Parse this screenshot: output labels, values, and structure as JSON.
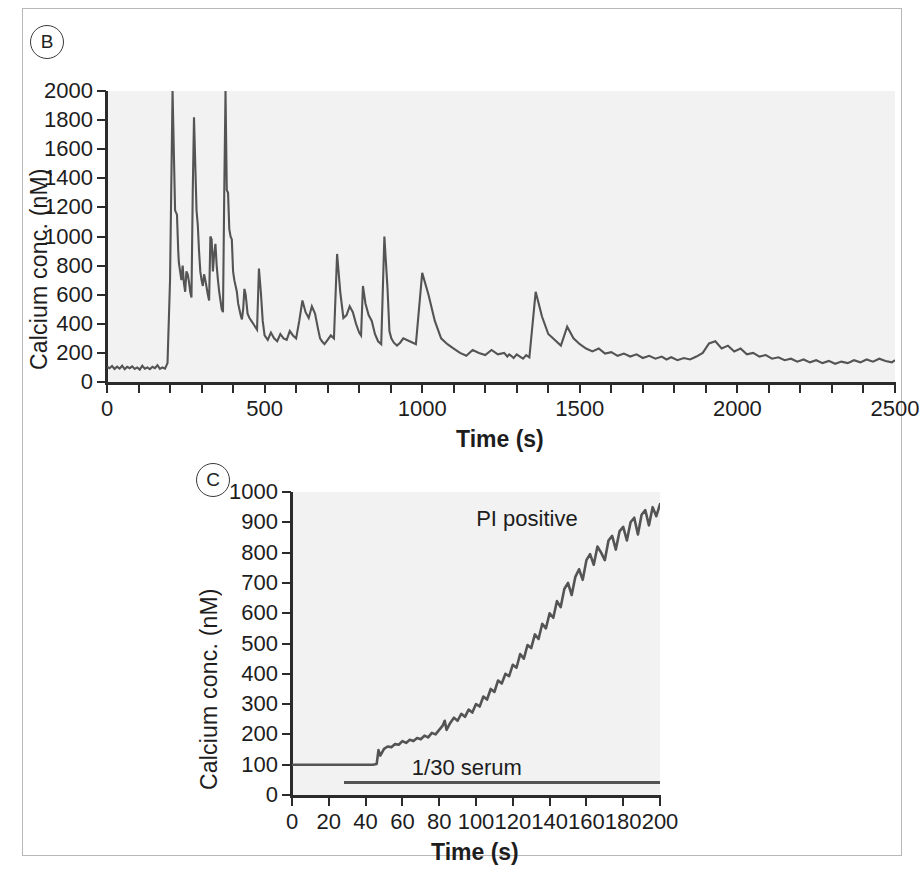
{
  "figure": {
    "panels": [
      {
        "tag": "B",
        "ylabel": "Calcium conc. (nM)",
        "xlabel": "Time (s)"
      },
      {
        "tag": "C",
        "ylabel": "Calcium conc. (nM)",
        "xlabel": "Time (s)",
        "annotation_pi": "PI positive",
        "annotation_serum": "1/30 serum"
      }
    ],
    "colors": {
      "trace": "#545454",
      "axis": "#2b2b2b",
      "plot_background": "#f2f2f2",
      "frame": "#b8b8b8",
      "text": "#1d1d1d"
    }
  },
  "chart_data": [
    {
      "type": "line",
      "panel": "B",
      "title": "",
      "xlabel": "Time (s)",
      "ylabel": "Calcium conc. (nM)",
      "xlim": [
        0,
        2500
      ],
      "ylim": [
        0,
        2000
      ],
      "xticks": [
        0,
        500,
        1000,
        1500,
        2000,
        2500
      ],
      "xtick_labels": [
        "0",
        "500",
        "1000",
        "1500",
        "2000",
        "2500"
      ],
      "xminor_interval": 100,
      "yticks": [
        0,
        200,
        400,
        600,
        800,
        1000,
        1200,
        1400,
        1600,
        1800,
        2000
      ],
      "ytick_labels": [
        "0",
        "200",
        "400",
        "600",
        "800",
        "1000",
        "1200",
        "1400",
        "1600",
        "1800",
        "2000"
      ],
      "grid": false,
      "legend": null,
      "series": [
        {
          "name": "Calcium trace (oscillating cell)",
          "description": "Baseline ~100 nM noise to t=225 s, then large spike train decaying to baseline by ~2000 s",
          "x": [
            0,
            8,
            16,
            24,
            32,
            40,
            48,
            56,
            64,
            72,
            80,
            88,
            96,
            104,
            112,
            120,
            128,
            136,
            144,
            152,
            160,
            168,
            176,
            184,
            192,
            200,
            208,
            216,
            222,
            226,
            228,
            232,
            236,
            240,
            244,
            248,
            252,
            256,
            260,
            264,
            268,
            272,
            276,
            280,
            284,
            288,
            292,
            296,
            300,
            304,
            308,
            312,
            316,
            320,
            324,
            328,
            332,
            336,
            340,
            344,
            348,
            352,
            356,
            360,
            364,
            368,
            372,
            376,
            380,
            384,
            388,
            392,
            396,
            400,
            404,
            408,
            412,
            416,
            420,
            424,
            428,
            432,
            436,
            440,
            446,
            452,
            458,
            464,
            470,
            476,
            482,
            488,
            494,
            500,
            510,
            520,
            530,
            540,
            550,
            560,
            570,
            580,
            590,
            600,
            610,
            620,
            630,
            640,
            650,
            660,
            670,
            676,
            682,
            690,
            700,
            710,
            720,
            730,
            740,
            750,
            760,
            770,
            780,
            790,
            800,
            806,
            812,
            820,
            830,
            840,
            850,
            860,
            870,
            880,
            890,
            896,
            902,
            910,
            920,
            930,
            940,
            960,
            980,
            1000,
            1020,
            1040,
            1060,
            1080,
            1100,
            1120,
            1140,
            1160,
            1180,
            1200,
            1220,
            1240,
            1260,
            1270,
            1276,
            1282,
            1290,
            1300,
            1310,
            1320,
            1330,
            1340,
            1360,
            1380,
            1400,
            1420,
            1440,
            1460,
            1480,
            1500,
            1520,
            1540,
            1560,
            1580,
            1600,
            1620,
            1640,
            1660,
            1680,
            1700,
            1720,
            1740,
            1760,
            1775,
            1790,
            1810,
            1830,
            1850,
            1870,
            1890,
            1910,
            1930,
            1950,
            1970,
            1990,
            2010,
            2030,
            2050,
            2070,
            2090,
            2110,
            2130,
            2150,
            2170,
            2190,
            2210,
            2230,
            2250,
            2270,
            2290,
            2310,
            2330,
            2350,
            2370,
            2390,
            2410,
            2430,
            2450,
            2470,
            2490,
            2500
          ],
          "y": [
            105,
            95,
            110,
            90,
            105,
            92,
            112,
            88,
            104,
            95,
            108,
            90,
            100,
            85,
            112,
            92,
            100,
            88,
            105,
            95,
            115,
            90,
            100,
            92,
            130,
            700,
            2000,
            1180,
            1150,
            900,
            820,
            760,
            700,
            800,
            680,
            620,
            760,
            740,
            690,
            620,
            580,
            1300,
            1820,
            1500,
            1180,
            1080,
            900,
            760,
            700,
            660,
            740,
            700,
            650,
            600,
            560,
            1000,
            980,
            760,
            880,
            950,
            800,
            700,
            620,
            560,
            500,
            480,
            1300,
            2000,
            1320,
            1300,
            1050,
            1000,
            980,
            760,
            700,
            660,
            620,
            540,
            500,
            460,
            430,
            500,
            640,
            600,
            470,
            440,
            420,
            400,
            380,
            360,
            780,
            620,
            420,
            320,
            290,
            340,
            300,
            280,
            330,
            300,
            290,
            350,
            320,
            300,
            420,
            560,
            480,
            440,
            520,
            470,
            360,
            300,
            280,
            260,
            290,
            320,
            300,
            880,
            620,
            440,
            460,
            520,
            480,
            400,
            340,
            320,
            660,
            540,
            460,
            420,
            330,
            280,
            260,
            1000,
            640,
            350,
            300,
            270,
            250,
            270,
            300,
            280,
            260,
            750,
            600,
            420,
            300,
            260,
            230,
            200,
            180,
            220,
            200,
            185,
            220,
            190,
            200,
            175,
            190,
            180,
            165,
            190,
            175,
            160,
            185,
            170,
            620,
            450,
            330,
            290,
            250,
            380,
            300,
            260,
            230,
            210,
            230,
            195,
            205,
            180,
            195,
            175,
            190,
            165,
            180,
            160,
            175,
            155,
            170,
            150,
            165,
            155,
            175,
            200,
            265,
            280,
            230,
            250,
            210,
            230,
            190,
            200,
            175,
            185,
            160,
            170,
            150,
            160,
            140,
            155,
            135,
            150,
            130,
            145,
            125,
            140,
            130,
            150,
            135,
            155,
            140,
            160,
            145,
            135,
            150,
            130,
            145,
            125,
            140,
            120,
            135,
            115,
            130,
            110,
            125,
            105,
            120,
            100,
            115,
            95,
            110,
            90,
            105,
            85,
            100,
            80,
            95,
            75,
            90,
            85
          ]
        }
      ]
    },
    {
      "type": "line",
      "panel": "C",
      "title": "",
      "xlabel": "Time (s)",
      "ylabel": "Calcium conc. (nM)",
      "xlim": [
        0,
        200
      ],
      "ylim": [
        0,
        1000
      ],
      "xticks": [
        0,
        20,
        40,
        60,
        80,
        100,
        120,
        140,
        160,
        180,
        200
      ],
      "xtick_labels": [
        "0",
        "20",
        "40",
        "60",
        "80",
        "100",
        "120",
        "140",
        "160",
        "180",
        "200"
      ],
      "yticks": [
        0,
        100,
        200,
        300,
        400,
        500,
        600,
        700,
        800,
        900,
        1000
      ],
      "ytick_labels": [
        "0",
        "100",
        "200",
        "300",
        "400",
        "500",
        "600",
        "700",
        "800",
        "900",
        "1000"
      ],
      "grid": false,
      "legend": null,
      "annotations": [
        {
          "text": "PI positive",
          "x": 130,
          "y": 910
        },
        {
          "text": "1/30 serum",
          "x": 95,
          "y": 90
        }
      ],
      "serum_bar": {
        "x_start": 28,
        "x_end": 200,
        "y": 45
      },
      "series": [
        {
          "name": "Calcium trace (PI positive cell)",
          "description": "Flat at 100 nM until ~46 s, then steady sawtooth rise to ~950 nM by 200 s",
          "x": [
            0,
            5,
            10,
            15,
            20,
            25,
            30,
            35,
            40,
            44,
            46,
            47,
            48,
            50,
            52,
            54,
            56,
            58,
            60,
            62,
            64,
            66,
            68,
            70,
            72,
            74,
            76,
            78,
            80,
            82,
            83,
            84,
            86,
            88,
            90,
            92,
            94,
            96,
            98,
            100,
            102,
            104,
            106,
            108,
            110,
            112,
            114,
            116,
            118,
            120,
            122,
            124,
            126,
            128,
            130,
            132,
            134,
            136,
            138,
            140,
            142,
            144,
            146,
            148,
            150,
            152,
            154,
            156,
            158,
            160,
            162,
            164,
            166,
            168,
            170,
            172,
            174,
            176,
            178,
            180,
            182,
            184,
            186,
            188,
            190,
            192,
            194,
            196,
            198,
            200
          ],
          "y": [
            100,
            100,
            100,
            100,
            100,
            100,
            100,
            100,
            100,
            100,
            102,
            148,
            130,
            152,
            160,
            158,
            168,
            166,
            178,
            172,
            182,
            178,
            188,
            184,
            196,
            190,
            205,
            200,
            215,
            230,
            245,
            215,
            238,
            255,
            245,
            268,
            258,
            282,
            272,
            300,
            292,
            325,
            315,
            350,
            340,
            378,
            368,
            400,
            392,
            430,
            420,
            465,
            450,
            495,
            485,
            530,
            515,
            565,
            550,
            600,
            585,
            640,
            620,
            680,
            700,
            660,
            720,
            745,
            710,
            775,
            795,
            760,
            820,
            800,
            775,
            840,
            855,
            810,
            870,
            885,
            840,
            900,
            915,
            860,
            925,
            940,
            890,
            950,
            920,
            960
          ]
        }
      ]
    }
  ]
}
